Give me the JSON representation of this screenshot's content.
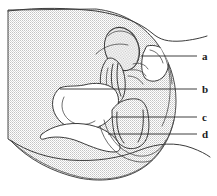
{
  "figure": {
    "caption": "",
    "style": "stippled line drawing, black and white",
    "background_color": "#ffffff",
    "line_color": "#3a3a3a",
    "stipple_color": "#b9b9b9",
    "width": 217,
    "height": 196
  },
  "labels": [
    {
      "id": "label-a",
      "text": "a",
      "x": 203,
      "y": 59,
      "leader": {
        "x1": 141,
        "y1": 56,
        "x2": 197,
        "y2": 56
      }
    },
    {
      "id": "label-b",
      "text": "b",
      "x": 203,
      "y": 92,
      "leader": {
        "x1": 60,
        "y1": 89,
        "x2": 197,
        "y2": 89
      }
    },
    {
      "id": "label-c",
      "text": "c",
      "x": 203,
      "y": 120,
      "leader": {
        "x1": 112,
        "y1": 117,
        "x2": 197,
        "y2": 117
      }
    },
    {
      "id": "label-d",
      "text": "d",
      "x": 203,
      "y": 137,
      "leader": {
        "x1": 108,
        "y1": 134,
        "x2": 197,
        "y2": 134
      }
    }
  ]
}
